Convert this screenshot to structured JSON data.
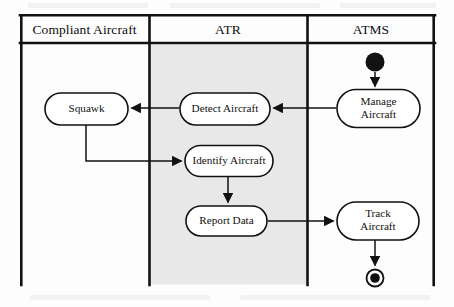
{
  "diagram": {
    "type": "uml-activity-swimlane",
    "frame": {
      "x": 20,
      "y": 14,
      "width": 415,
      "height": 271,
      "border_color": "#111111"
    },
    "header_row": {
      "y": 14,
      "height": 29,
      "divider_y": 43
    },
    "lanes": [
      {
        "id": "compliant-aircraft",
        "label": "Compliant Aircraft",
        "x": 20,
        "width": 129,
        "shaded": false,
        "fill": "#ffffff",
        "title_center_x": 84.5
      },
      {
        "id": "atr",
        "label": "ATR",
        "x": 149,
        "width": 158,
        "shaded": true,
        "fill": "#e8e8e8",
        "title_center_x": 228
      },
      {
        "id": "atms",
        "label": "ATMS",
        "x": 307,
        "width": 128,
        "shaded": false,
        "fill": "#ffffff",
        "title_center_x": 371
      }
    ],
    "lane_dividers_x": [
      149,
      307
    ],
    "nodes": [
      {
        "id": "start",
        "kind": "initial-node",
        "lane": "atms",
        "label": "",
        "cx": 375,
        "cy": 62,
        "r": 9.5,
        "fill": "#111111"
      },
      {
        "id": "manage-aircraft",
        "kind": "action",
        "lane": "atms",
        "label": "Manage Aircraft",
        "lines": [
          "Manage",
          "Aircraft"
        ],
        "x": 337,
        "y": 90,
        "width": 83,
        "height": 38
      },
      {
        "id": "detect-aircraft",
        "kind": "action",
        "lane": "atr",
        "label": "Detect Aircraft",
        "lines": [
          "Detect Aircraft"
        ],
        "x": 180,
        "y": 93,
        "width": 90,
        "height": 32
      },
      {
        "id": "squawk",
        "kind": "action",
        "lane": "compliant-aircraft",
        "label": "Squawk",
        "lines": [
          "Squawk"
        ],
        "x": 45,
        "y": 93,
        "width": 83,
        "height": 32
      },
      {
        "id": "identify-aircraft",
        "kind": "action",
        "lane": "atr",
        "label": "Identify Aircraft",
        "lines": [
          "Identify Aircraft"
        ],
        "x": 185,
        "y": 145,
        "width": 88,
        "height": 31
      },
      {
        "id": "report-data",
        "kind": "action",
        "lane": "atr",
        "label": "Report Data",
        "lines": [
          "Report Data"
        ],
        "x": 186,
        "y": 206,
        "width": 81,
        "height": 30
      },
      {
        "id": "track-aircraft",
        "kind": "action",
        "lane": "atms",
        "label": "Track Aircraft",
        "lines": [
          "Track",
          "Aircraft"
        ],
        "x": 337,
        "y": 202,
        "width": 82,
        "height": 38
      },
      {
        "id": "end",
        "kind": "final-node",
        "lane": "atms",
        "label": "",
        "cx": 375,
        "cy": 278,
        "r_outer": 8.5,
        "r_inner": 4.8,
        "fill": "#111111"
      }
    ],
    "edges": [
      {
        "id": "start-to-manage",
        "from": "start",
        "to": "manage-aircraft",
        "path": "M375,72 L375,88",
        "arrow": "down"
      },
      {
        "id": "manage-to-detect",
        "from": "manage-aircraft",
        "to": "detect-aircraft",
        "path": "M336,108 L273,108",
        "arrow": "left"
      },
      {
        "id": "detect-to-squawk",
        "from": "detect-aircraft",
        "to": "squawk",
        "path": "M179,108 L131,108",
        "arrow": "left"
      },
      {
        "id": "squawk-to-identify",
        "from": "squawk",
        "to": "identify-aircraft",
        "path": "M86,126 L86,161 L182,161",
        "arrow": "right"
      },
      {
        "id": "identify-to-report",
        "from": "identify-aircraft",
        "to": "report-data",
        "path": "M228,177 L228,204",
        "arrow": "down"
      },
      {
        "id": "report-to-track",
        "from": "report-data",
        "to": "track-aircraft",
        "path": "M268,221 L334,221",
        "arrow": "right"
      },
      {
        "id": "track-to-end",
        "from": "track-aircraft",
        "to": "end",
        "path": "M375,241 L375,268",
        "arrow": "down"
      }
    ],
    "style": {
      "stroke": "#111111",
      "node_fill": "#ffffff",
      "node_stroke_width": 1.6,
      "frame_stroke_width": 2.6,
      "edge_stroke_width": 1.5,
      "atr_lane_fill": "#e8e8e8",
      "page_background": "#fdfdfd"
    }
  }
}
